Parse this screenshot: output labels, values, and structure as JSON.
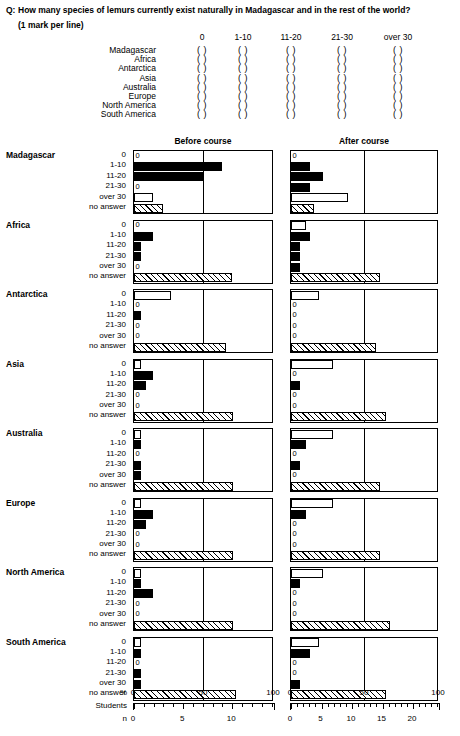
{
  "question": {
    "tag": "Q:",
    "text": "How many species of lemurs currently exist naturally in Madagascar and in the rest of the world?",
    "instruction": "(1 mark per line)"
  },
  "answer_grid": {
    "columns": [
      "0",
      "1-10",
      "11-20",
      "21-30",
      "over 30"
    ],
    "rows": [
      "Madagascar",
      "Africa",
      "Antarctica",
      "Asia",
      "Australia",
      "Europe",
      "North America",
      "South America"
    ],
    "bracket_glyph": "( )"
  },
  "chart_headers": {
    "before": "Before course",
    "after": "After course"
  },
  "axis": {
    "percent_label": "%",
    "students_label": "Students",
    "n_label": "n",
    "percent_ticks": [
      "0",
      "50",
      "100"
    ],
    "before_n_ticks": [
      "0",
      "5",
      "10"
    ],
    "after_n_ticks": [
      "0",
      "5",
      "10",
      "15",
      "20"
    ]
  },
  "chart_data": {
    "type": "bar",
    "title": "How many species of lemurs currently exist naturally in Madagascar and in the rest of the world?",
    "xlabel": "%",
    "ylabel": "",
    "xlim": [
      0,
      100
    ],
    "grid": false,
    "orientation": "horizontal",
    "legend": [
      "Before course",
      "After course"
    ],
    "legend_position": "top",
    "categories": [
      "0",
      "1-10",
      "11-20",
      "21-30",
      "over 30",
      "no answer"
    ],
    "units": "percent of students",
    "panels": [
      {
        "region": "Madagascar",
        "before": [
          {
            "category": "0",
            "value": 0,
            "style": "zero"
          },
          {
            "category": "1-10",
            "value": 64,
            "style": "solid"
          },
          {
            "category": "11-20",
            "value": 50,
            "style": "solid"
          },
          {
            "category": "21-30",
            "value": 0,
            "style": "zero"
          },
          {
            "category": "over 30",
            "value": 14,
            "style": "open"
          },
          {
            "category": "no answer",
            "value": 21,
            "style": "hatch"
          }
        ],
        "after": [
          {
            "category": "0",
            "value": 0,
            "style": "zero"
          },
          {
            "category": "1-10",
            "value": 13,
            "style": "solid"
          },
          {
            "category": "11-20",
            "value": 22,
            "style": "solid"
          },
          {
            "category": "21-30",
            "value": 13,
            "style": "solid"
          },
          {
            "category": "over 30",
            "value": 39,
            "style": "open"
          },
          {
            "category": "no answer",
            "value": 16,
            "style": "hatch"
          }
        ]
      },
      {
        "region": "Africa",
        "before": [
          {
            "category": "0",
            "value": 0,
            "style": "zero"
          },
          {
            "category": "1-10",
            "value": 14,
            "style": "solid"
          },
          {
            "category": "11-20",
            "value": 5,
            "style": "solid"
          },
          {
            "category": "21-30",
            "value": 5,
            "style": "solid"
          },
          {
            "category": "over 30",
            "value": 0,
            "style": "zero"
          },
          {
            "category": "no answer",
            "value": 71,
            "style": "hatch"
          }
        ],
        "after": [
          {
            "category": "0",
            "value": 10,
            "style": "open"
          },
          {
            "category": "1-10",
            "value": 13,
            "style": "solid"
          },
          {
            "category": "11-20",
            "value": 6,
            "style": "solid"
          },
          {
            "category": "21-30",
            "value": 6,
            "style": "solid"
          },
          {
            "category": "over 30",
            "value": 6,
            "style": "solid"
          },
          {
            "category": "no answer",
            "value": 61,
            "style": "hatch"
          }
        ]
      },
      {
        "region": "Antarctica",
        "before": [
          {
            "category": "0",
            "value": 27,
            "style": "open"
          },
          {
            "category": "1-10",
            "value": 0,
            "style": "zero"
          },
          {
            "category": "11-20",
            "value": 5,
            "style": "solid"
          },
          {
            "category": "21-30",
            "value": 0,
            "style": "zero"
          },
          {
            "category": "over 30",
            "value": 0,
            "style": "zero"
          },
          {
            "category": "no answer",
            "value": 67,
            "style": "hatch"
          }
        ],
        "after": [
          {
            "category": "0",
            "value": 19,
            "style": "open"
          },
          {
            "category": "1-10",
            "value": 0,
            "style": "zero"
          },
          {
            "category": "11-20",
            "value": 0,
            "style": "zero"
          },
          {
            "category": "21-30",
            "value": 0,
            "style": "zero"
          },
          {
            "category": "over 30",
            "value": 0,
            "style": "zero"
          },
          {
            "category": "no answer",
            "value": 58,
            "style": "hatch"
          }
        ]
      },
      {
        "region": "Asia",
        "before": [
          {
            "category": "0",
            "value": 5,
            "style": "open"
          },
          {
            "category": "1-10",
            "value": 14,
            "style": "solid"
          },
          {
            "category": "11-20",
            "value": 9,
            "style": "solid"
          },
          {
            "category": "21-30",
            "value": 0,
            "style": "zero"
          },
          {
            "category": "over 30",
            "value": 0,
            "style": "zero"
          },
          {
            "category": "no answer",
            "value": 72,
            "style": "hatch"
          }
        ],
        "after": [
          {
            "category": "0",
            "value": 29,
            "style": "open"
          },
          {
            "category": "1-10",
            "value": 0,
            "style": "zero"
          },
          {
            "category": "11-20",
            "value": 6,
            "style": "solid"
          },
          {
            "category": "21-30",
            "value": 0,
            "style": "zero"
          },
          {
            "category": "over 30",
            "value": 0,
            "style": "zero"
          },
          {
            "category": "no answer",
            "value": 65,
            "style": "hatch"
          }
        ]
      },
      {
        "region": "Australia",
        "before": [
          {
            "category": "0",
            "value": 5,
            "style": "open"
          },
          {
            "category": "1-10",
            "value": 5,
            "style": "solid"
          },
          {
            "category": "11-20",
            "value": 0,
            "style": "zero"
          },
          {
            "category": "21-30",
            "value": 5,
            "style": "solid"
          },
          {
            "category": "over 30",
            "value": 5,
            "style": "solid"
          },
          {
            "category": "no answer",
            "value": 72,
            "style": "hatch"
          }
        ],
        "after": [
          {
            "category": "0",
            "value": 29,
            "style": "open"
          },
          {
            "category": "1-10",
            "value": 10,
            "style": "solid"
          },
          {
            "category": "11-20",
            "value": 0,
            "style": "zero"
          },
          {
            "category": "21-30",
            "value": 6,
            "style": "solid"
          },
          {
            "category": "over 30",
            "value": 0,
            "style": "zero"
          },
          {
            "category": "no answer",
            "value": 61,
            "style": "hatch"
          }
        ]
      },
      {
        "region": "Europe",
        "before": [
          {
            "category": "0",
            "value": 5,
            "style": "open"
          },
          {
            "category": "1-10",
            "value": 14,
            "style": "solid"
          },
          {
            "category": "11-20",
            "value": 9,
            "style": "solid"
          },
          {
            "category": "21-30",
            "value": 0,
            "style": "zero"
          },
          {
            "category": "over 30",
            "value": 0,
            "style": "zero"
          },
          {
            "category": "no answer",
            "value": 72,
            "style": "hatch"
          }
        ],
        "after": [
          {
            "category": "0",
            "value": 29,
            "style": "open"
          },
          {
            "category": "1-10",
            "value": 10,
            "style": "solid"
          },
          {
            "category": "11-20",
            "value": 0,
            "style": "zero"
          },
          {
            "category": "21-30",
            "value": 0,
            "style": "zero"
          },
          {
            "category": "over 30",
            "value": 0,
            "style": "zero"
          },
          {
            "category": "no answer",
            "value": 61,
            "style": "hatch"
          }
        ]
      },
      {
        "region": "North America",
        "before": [
          {
            "category": "0",
            "value": 5,
            "style": "open"
          },
          {
            "category": "1-10",
            "value": 5,
            "style": "solid"
          },
          {
            "category": "11-20",
            "value": 14,
            "style": "solid"
          },
          {
            "category": "21-30",
            "value": 0,
            "style": "zero"
          },
          {
            "category": "over 30",
            "value": 0,
            "style": "zero"
          },
          {
            "category": "no answer",
            "value": 72,
            "style": "hatch"
          }
        ],
        "after": [
          {
            "category": "0",
            "value": 22,
            "style": "open"
          },
          {
            "category": "1-10",
            "value": 6,
            "style": "solid"
          },
          {
            "category": "11-20",
            "value": 0,
            "style": "zero"
          },
          {
            "category": "21-30",
            "value": 0,
            "style": "zero"
          },
          {
            "category": "over 30",
            "value": 0,
            "style": "zero"
          },
          {
            "category": "no answer",
            "value": 68,
            "style": "hatch"
          }
        ]
      },
      {
        "region": "South America",
        "before": [
          {
            "category": "0",
            "value": 5,
            "style": "open"
          },
          {
            "category": "1-10",
            "value": 5,
            "style": "solid"
          },
          {
            "category": "11-20",
            "value": 0,
            "style": "zero"
          },
          {
            "category": "21-30",
            "value": 5,
            "style": "solid"
          },
          {
            "category": "over 30",
            "value": 5,
            "style": "solid"
          },
          {
            "category": "no answer",
            "value": 74,
            "style": "hatch"
          }
        ],
        "after": [
          {
            "category": "0",
            "value": 19,
            "style": "open"
          },
          {
            "category": "1-10",
            "value": 13,
            "style": "solid"
          },
          {
            "category": "11-20",
            "value": 0,
            "style": "zero"
          },
          {
            "category": "21-30",
            "value": 0,
            "style": "zero"
          },
          {
            "category": "over 30",
            "value": 6,
            "style": "solid"
          },
          {
            "category": "no answer",
            "value": 65,
            "style": "hatch"
          }
        ]
      }
    ]
  }
}
